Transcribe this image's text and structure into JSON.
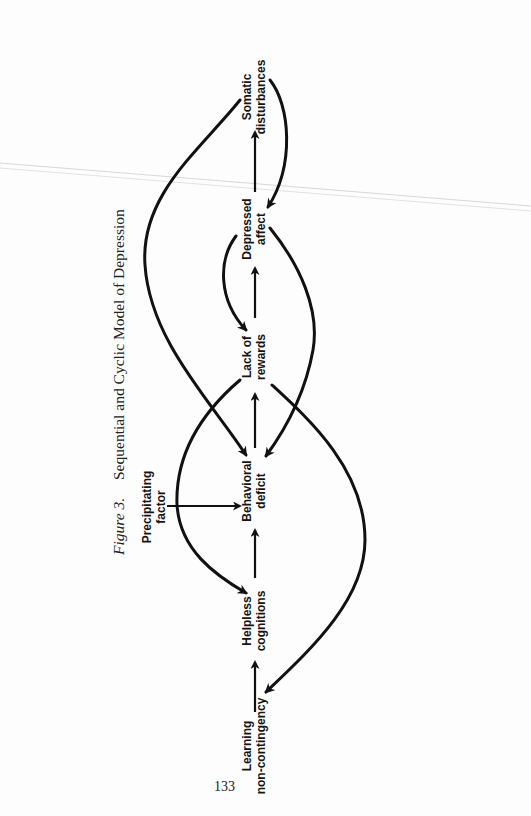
{
  "figure": {
    "label": "Figure 3.",
    "title": "Sequential and Cyclic Model of Depression"
  },
  "nodes": [
    {
      "id": "somatic",
      "line1": "Somatic",
      "line2": "disturbances"
    },
    {
      "id": "depressed",
      "line1": "Depressed",
      "line2": "affect"
    },
    {
      "id": "lack",
      "line1": "Lack of",
      "line2": "rewards"
    },
    {
      "id": "behavioral",
      "line1": "Behavioral",
      "line2": "deficit"
    },
    {
      "id": "helpless",
      "line1": "Helpless",
      "line2": "cognitions"
    },
    {
      "id": "learning",
      "line1": "Learning",
      "line2": "non-contingency"
    }
  ],
  "precipitating": {
    "line1": "Precipitating",
    "line2": "factor"
  },
  "sequence_edges": [
    {
      "from": "Learning non-contingency",
      "to": "Helpless cognitions"
    },
    {
      "from": "Helpless cognitions",
      "to": "Behavioral deficit"
    },
    {
      "from": "Behavioral deficit",
      "to": "Lack of rewards"
    },
    {
      "from": "Lack of rewards",
      "to": "Depressed affect"
    },
    {
      "from": "Depressed affect",
      "to": "Somatic disturbances"
    },
    {
      "from": "Precipitating factor",
      "to": "Behavioral deficit"
    }
  ],
  "feedback_edges": [
    {
      "from": "Somatic disturbances",
      "to": "Behavioral deficit"
    },
    {
      "from": "Somatic disturbances",
      "to": "Depressed affect"
    },
    {
      "from": "Depressed affect",
      "to": "Lack of rewards"
    },
    {
      "from": "Depressed affect",
      "to": "Behavioral deficit"
    },
    {
      "from": "Lack of rewards",
      "to": "Helpless cognitions"
    },
    {
      "from": "Lack of rewards",
      "to": "Learning non-contingency"
    }
  ],
  "page_number": "133",
  "colors": {
    "ink": "#111111",
    "paper": "#fdfdfd",
    "scan_line": "#d6d6d6"
  }
}
